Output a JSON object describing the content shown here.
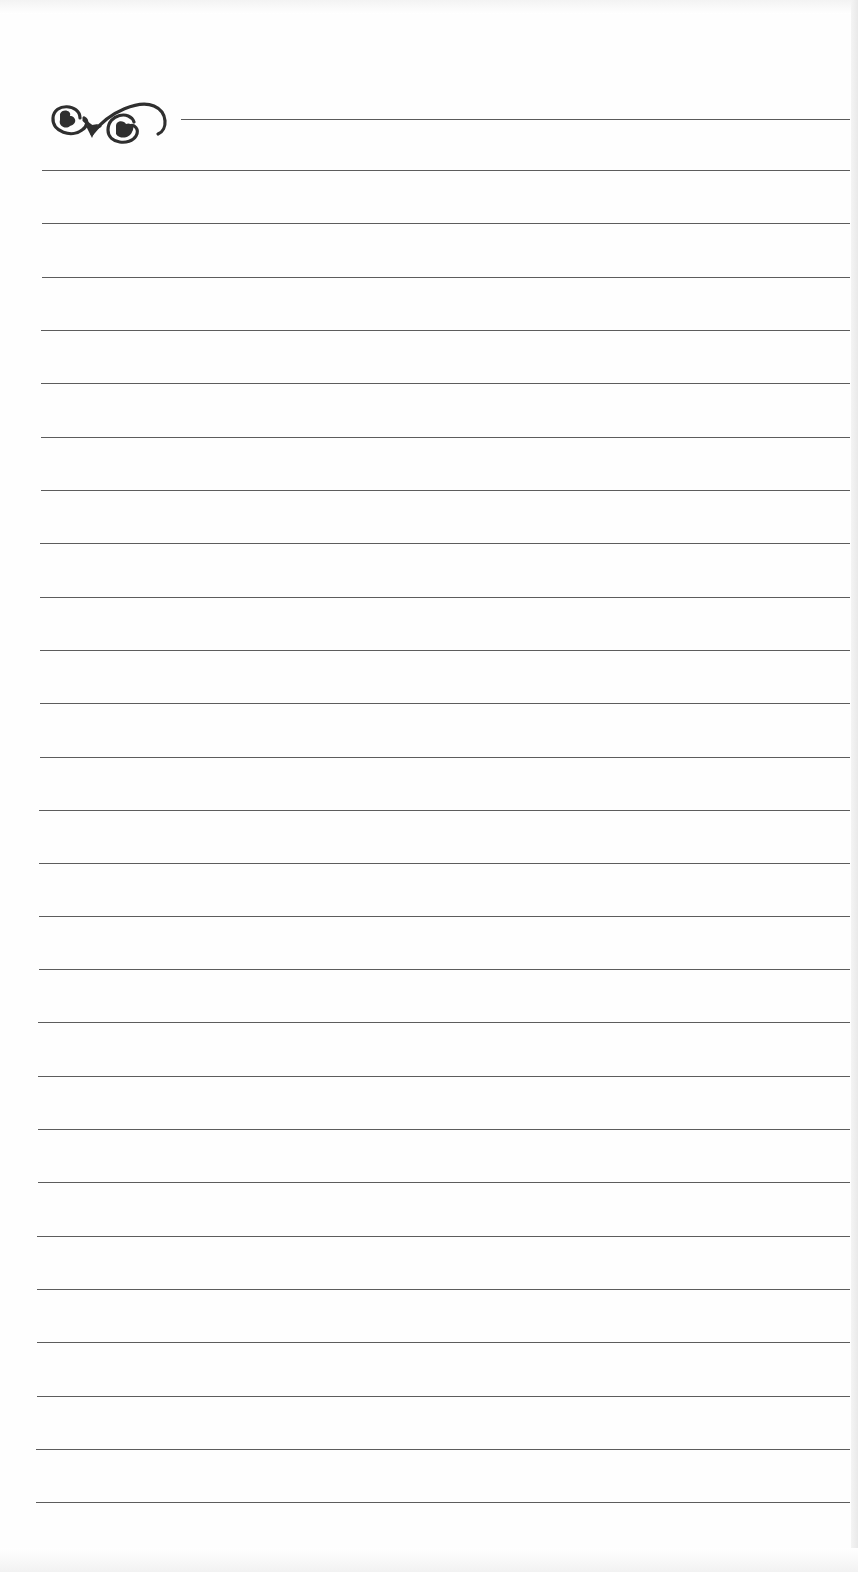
{
  "page": {
    "type": "lined notepaper",
    "background_color": "#ffffff",
    "line_color": "#5c5c5c",
    "ornament": {
      "icon": "scroll-flourish-icon",
      "color": "#2f2f2f"
    },
    "rule_count": 26,
    "rules": [
      {
        "y": 170,
        "x1": 42,
        "x2": 850
      },
      {
        "y": 223,
        "x1": 42,
        "x2": 850
      },
      {
        "y": 277,
        "x1": 42,
        "x2": 850
      },
      {
        "y": 330,
        "x1": 41,
        "x2": 850
      },
      {
        "y": 383,
        "x1": 41,
        "x2": 850
      },
      {
        "y": 437,
        "x1": 41,
        "x2": 850
      },
      {
        "y": 490,
        "x1": 41,
        "x2": 850
      },
      {
        "y": 543,
        "x1": 40,
        "x2": 850
      },
      {
        "y": 597,
        "x1": 40,
        "x2": 850
      },
      {
        "y": 650,
        "x1": 40,
        "x2": 850
      },
      {
        "y": 703,
        "x1": 40,
        "x2": 850
      },
      {
        "y": 757,
        "x1": 40,
        "x2": 850
      },
      {
        "y": 810,
        "x1": 39,
        "x2": 850
      },
      {
        "y": 863,
        "x1": 39,
        "x2": 850
      },
      {
        "y": 916,
        "x1": 39,
        "x2": 850
      },
      {
        "y": 969,
        "x1": 39,
        "x2": 850
      },
      {
        "y": 1022,
        "x1": 38,
        "x2": 850
      },
      {
        "y": 1076,
        "x1": 38,
        "x2": 850
      },
      {
        "y": 1129,
        "x1": 38,
        "x2": 850
      },
      {
        "y": 1182,
        "x1": 38,
        "x2": 850
      },
      {
        "y": 1236,
        "x1": 37,
        "x2": 850
      },
      {
        "y": 1289,
        "x1": 37,
        "x2": 850
      },
      {
        "y": 1342,
        "x1": 37,
        "x2": 850
      },
      {
        "y": 1396,
        "x1": 37,
        "x2": 850
      },
      {
        "y": 1449,
        "x1": 36,
        "x2": 850
      },
      {
        "y": 1502,
        "x1": 36,
        "x2": 850
      }
    ]
  }
}
